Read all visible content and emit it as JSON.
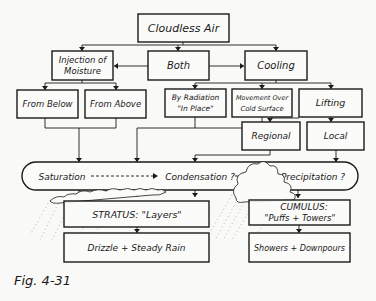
{
  "diagram": {
    "nodes": {
      "cloudless_air": "Cloudless Air",
      "injection_line1": "Injection of",
      "injection_line2": "Moisture",
      "both": "Both",
      "cooling": "Cooling",
      "from_below": "From Below",
      "from_above": "From Above",
      "radiation_line1": "By Radiation",
      "radiation_line2": "\"In Place\"",
      "movement_line1": "Movement Over",
      "movement_line2": "Cold Surface",
      "lifting": "Lifting",
      "regional": "Regional",
      "local": "Local",
      "saturation": "Saturation",
      "condensation": "Condensation ?",
      "precipitation": "Precipitation ?",
      "stratus": "STRATUS: \"Layers\"",
      "cumulus_line1": "CUMULUS:",
      "cumulus_line2": "\"Puffs + Towers\"",
      "drizzle": "Drizzle + Steady Rain",
      "showers": "Showers + Downpours"
    },
    "caption": "Fig. 4-31"
  }
}
